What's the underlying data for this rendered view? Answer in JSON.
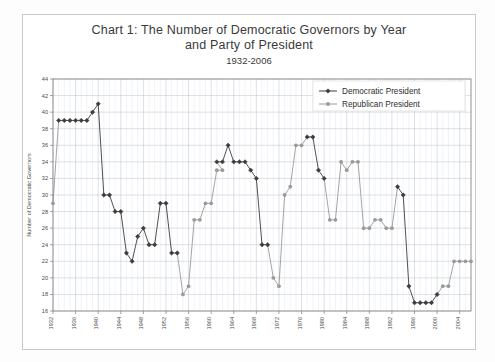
{
  "chart_data": {
    "type": "line",
    "title": "Chart 1: The Number of Democratic Governors by Year and Party of President",
    "title_line1": "Chart 1: The Number of Democratic Governors by Year",
    "title_line2": "and Party of President",
    "subtitle": "1932-2006",
    "xlabel": "",
    "ylabel": "Number of Democratic Governors",
    "ylim": [
      16,
      44
    ],
    "ytick_step": 2,
    "yticks": [
      16,
      18,
      20,
      22,
      24,
      26,
      28,
      30,
      32,
      34,
      36,
      38,
      40,
      42,
      44
    ],
    "xlim": [
      1932,
      2006
    ],
    "xticks": [
      1932,
      1936,
      1940,
      1944,
      1948,
      1952,
      1956,
      1960,
      1964,
      1968,
      1972,
      1976,
      1980,
      1984,
      1988,
      1992,
      1996,
      2000,
      2004
    ],
    "grid": true,
    "grid_minor_x": true,
    "legend_position": "top-right",
    "colors": {
      "democratic": "#3c3c3c",
      "republican": "#9a9a9a",
      "grid_major": "#b9c0cc",
      "grid_minor": "#e2e6ee",
      "axis": "#7d7d7d",
      "frame": "#c9c9c9",
      "text": "#3a3a3a"
    },
    "series": [
      {
        "name": "Democratic President",
        "color": "#3c3c3c",
        "marker": "diamond",
        "points": [
          {
            "x": 1933,
            "y": 39
          },
          {
            "x": 1934,
            "y": 39
          },
          {
            "x": 1935,
            "y": 39
          },
          {
            "x": 1936,
            "y": 39
          },
          {
            "x": 1937,
            "y": 39
          },
          {
            "x": 1938,
            "y": 39
          },
          {
            "x": 1939,
            "y": 40
          },
          {
            "x": 1940,
            "y": 41
          },
          {
            "x": 1941,
            "y": 30
          },
          {
            "x": 1942,
            "y": 30
          },
          {
            "x": 1943,
            "y": 28
          },
          {
            "x": 1944,
            "y": 28
          },
          {
            "x": 1945,
            "y": 23
          },
          {
            "x": 1946,
            "y": 22
          },
          {
            "x": 1947,
            "y": 25
          },
          {
            "x": 1948,
            "y": 26
          },
          {
            "x": 1949,
            "y": 24
          },
          {
            "x": 1950,
            "y": 24
          },
          {
            "x": 1951,
            "y": 29
          },
          {
            "x": 1952,
            "y": 29
          },
          {
            "x": 1953,
            "y": 23
          },
          {
            "x": 1954,
            "y": 23
          },
          {
            "x": 1961,
            "y": 34
          },
          {
            "x": 1962,
            "y": 34
          },
          {
            "x": 1963,
            "y": 36
          },
          {
            "x": 1964,
            "y": 34
          },
          {
            "x": 1965,
            "y": 34
          },
          {
            "x": 1966,
            "y": 34
          },
          {
            "x": 1967,
            "y": 33
          },
          {
            "x": 1968,
            "y": 32
          },
          {
            "x": 1969,
            "y": 24
          },
          {
            "x": 1970,
            "y": 24
          },
          {
            "x": 1977,
            "y": 37
          },
          {
            "x": 1978,
            "y": 37
          },
          {
            "x": 1979,
            "y": 33
          },
          {
            "x": 1980,
            "y": 32
          },
          {
            "x": 1993,
            "y": 31
          },
          {
            "x": 1994,
            "y": 30
          },
          {
            "x": 1995,
            "y": 19
          },
          {
            "x": 1996,
            "y": 17
          },
          {
            "x": 1997,
            "y": 17
          },
          {
            "x": 1998,
            "y": 17
          },
          {
            "x": 1999,
            "y": 17
          },
          {
            "x": 2000,
            "y": 18
          }
        ]
      },
      {
        "name": "Republican President",
        "color": "#9a9a9a",
        "marker": "circle",
        "points": [
          {
            "x": 1932,
            "y": 29
          },
          {
            "x": 1955,
            "y": 18
          },
          {
            "x": 1956,
            "y": 19
          },
          {
            "x": 1957,
            "y": 27
          },
          {
            "x": 1958,
            "y": 27
          },
          {
            "x": 1959,
            "y": 29
          },
          {
            "x": 1960,
            "y": 29
          },
          {
            "x": 1961,
            "y": 33
          },
          {
            "x": 1962,
            "y": 33
          },
          {
            "x": 1971,
            "y": 20
          },
          {
            "x": 1972,
            "y": 19
          },
          {
            "x": 1973,
            "y": 30
          },
          {
            "x": 1974,
            "y": 31
          },
          {
            "x": 1975,
            "y": 36
          },
          {
            "x": 1976,
            "y": 36
          },
          {
            "x": 1981,
            "y": 27
          },
          {
            "x": 1982,
            "y": 27
          },
          {
            "x": 1983,
            "y": 34
          },
          {
            "x": 1984,
            "y": 33
          },
          {
            "x": 1985,
            "y": 34
          },
          {
            "x": 1986,
            "y": 34
          },
          {
            "x": 1987,
            "y": 26
          },
          {
            "x": 1988,
            "y": 26
          },
          {
            "x": 1989,
            "y": 27
          },
          {
            "x": 1990,
            "y": 27
          },
          {
            "x": 1991,
            "y": 26
          },
          {
            "x": 1992,
            "y": 26
          },
          {
            "x": 2001,
            "y": 19
          },
          {
            "x": 2002,
            "y": 19
          },
          {
            "x": 2003,
            "y": 22
          },
          {
            "x": 2004,
            "y": 22
          },
          {
            "x": 2005,
            "y": 22
          },
          {
            "x": 2006,
            "y": 22
          }
        ]
      }
    ],
    "legend": [
      {
        "label": "Democratic President",
        "color": "#3c3c3c",
        "marker": "diamond"
      },
      {
        "label": "Republican President",
        "color": "#9a9a9a",
        "marker": "circle"
      }
    ]
  }
}
